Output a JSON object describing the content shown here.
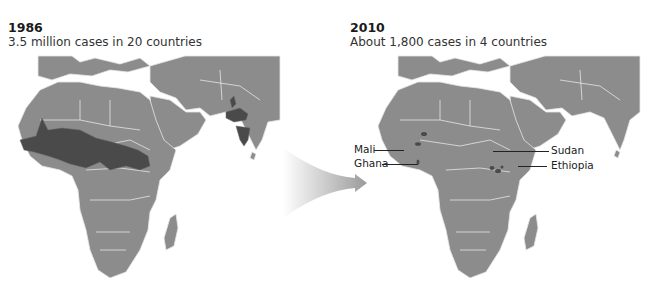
{
  "panels": {
    "left": {
      "year": "1986",
      "subtitle": "3.5 million cases in 20 countries"
    },
    "right": {
      "year": "2010",
      "subtitle": "About 1,800 cases in 4 countries",
      "labels": {
        "mali": "Mali",
        "ghana": "Ghana",
        "sudan": "Sudan",
        "ethiopia": "Ethiopia"
      }
    }
  },
  "colors": {
    "land": "#8c8c8c",
    "endemic": "#4a4a4a",
    "border": "#e6e6e6",
    "background": "#ffffff",
    "arrow_start": "#ffffff",
    "arrow_end": "#9a9a9a"
  },
  "legend_semantics": {
    "dark_regions": "endemic countries/areas",
    "light_regions": "non-endemic land"
  }
}
